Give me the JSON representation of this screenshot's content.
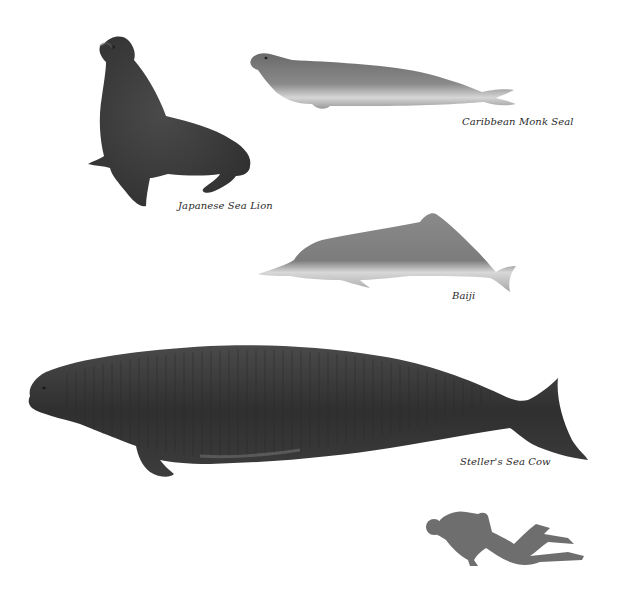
{
  "figure": {
    "type": "species-size-comparison-illustration",
    "animals": [
      {
        "id": "japanese-sea-lion",
        "label": "Japanese Sea Lion"
      },
      {
        "id": "caribbean-monk-seal",
        "label": "Caribbean Monk Seal"
      },
      {
        "id": "baiji",
        "label": "Baiji"
      },
      {
        "id": "stellers-sea-cow",
        "label": "Steller's Sea Cow"
      },
      {
        "id": "scuba-diver",
        "label": ""
      }
    ],
    "colors": {
      "background": "#ffffff",
      "sea_lion": "#3e3e3e",
      "monk_seal": "#7a7a7a",
      "baiji": "#8c8c8c",
      "sea_cow": "#3a3a3a",
      "diver": "#6e6e6e",
      "label": "#2a2a2a"
    }
  }
}
